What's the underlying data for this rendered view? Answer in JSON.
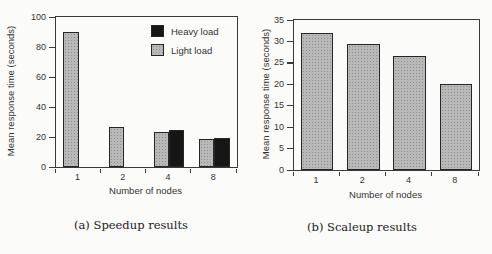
{
  "figure": {
    "background_color": "#fbfbf9",
    "bar_gray_color": "#b9b9b9",
    "bar_black_color": "#161616",
    "axis_color": "#3a3a3a"
  },
  "chart_data": [
    {
      "type": "bar",
      "title": "(a) Speedup results",
      "xlabel": "Number of nodes",
      "ylabel": "Mean response time (seconds)",
      "categories": [
        "1",
        "2",
        "4",
        "8"
      ],
      "series": [
        {
          "name": "Heavy load",
          "color": "#161616",
          "style": "solid-dark",
          "values": [
            null,
            null,
            25,
            19.5
          ]
        },
        {
          "name": "Light load",
          "color": "#b9b9b9",
          "style": "stipple",
          "values": [
            90,
            27,
            23.5,
            19
          ]
        }
      ],
      "ylim": [
        0,
        100
      ],
      "yticks": [
        0,
        20,
        40,
        60,
        80,
        100
      ],
      "legend_position": "top-right",
      "grid": false
    },
    {
      "type": "bar",
      "title": "(b) Scaleup results",
      "xlabel": "Number of nodes",
      "ylabel": "Mean response time (seconds)",
      "categories": [
        "1",
        "2",
        "4",
        "8"
      ],
      "series": [
        {
          "name": "Light load",
          "color": "#b9b9b9",
          "style": "stipple",
          "values": [
            32,
            29.5,
            26.5,
            20
          ]
        }
      ],
      "ylim": [
        0,
        35
      ],
      "yticks": [
        0,
        5,
        10,
        15,
        20,
        25,
        30,
        35
      ],
      "legend_position": "none",
      "grid": false
    }
  ]
}
